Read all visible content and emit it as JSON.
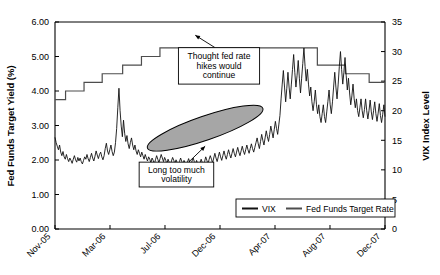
{
  "chart_data": {
    "type": "line",
    "title": "",
    "xlabel": "",
    "ylabel": "Fed Funds Target Yield (%)",
    "y2label": "VIX Index Level",
    "ylim": [
      0.0,
      6.0
    ],
    "y2lim": [
      0,
      35
    ],
    "grid": false,
    "legend_position": "bottom-right",
    "y_ticks": [
      "0.00",
      "1.00",
      "2.00",
      "3.00",
      "4.00",
      "5.00",
      "6.00"
    ],
    "y_tick_values": [
      0.0,
      1.0,
      2.0,
      3.0,
      4.0,
      5.0,
      6.0
    ],
    "y2_ticks": [
      "0",
      "5",
      "10",
      "15",
      "20",
      "25",
      "30",
      "35"
    ],
    "y2_tick_values": [
      0,
      5,
      10,
      15,
      20,
      25,
      30,
      35
    ],
    "x_ticks": [
      "Nov-05",
      "Mar-06",
      "Jul-06",
      "Dec-06",
      "Apr-07",
      "Aug-07",
      "Dec-07"
    ],
    "x_tick_positions": [
      0.0,
      0.1667,
      0.3333,
      0.5,
      0.6667,
      0.8333,
      1.0
    ],
    "series": [
      {
        "name": "Fed Funds Target Rate",
        "axis": "left",
        "color": "#4d4d4d",
        "style": "step",
        "points": [
          [
            0.0,
            3.75
          ],
          [
            0.032,
            3.75
          ],
          [
            0.032,
            4.0
          ],
          [
            0.088,
            4.0
          ],
          [
            0.088,
            4.25
          ],
          [
            0.143,
            4.25
          ],
          [
            0.143,
            4.5
          ],
          [
            0.205,
            4.5
          ],
          [
            0.205,
            4.75
          ],
          [
            0.262,
            4.75
          ],
          [
            0.262,
            5.0
          ],
          [
            0.318,
            5.0
          ],
          [
            0.318,
            5.25
          ],
          [
            0.795,
            5.25
          ],
          [
            0.795,
            4.75
          ],
          [
            0.88,
            4.75
          ],
          [
            0.88,
            4.5
          ],
          [
            0.952,
            4.5
          ],
          [
            0.952,
            4.25
          ],
          [
            1.0,
            4.25
          ]
        ]
      },
      {
        "name": "VIX",
        "axis": "right",
        "color": "#111111",
        "style": "line",
        "values": [
          15.5,
          14.6,
          14.0,
          13.4,
          14.2,
          13.0,
          12.4,
          13.1,
          12.2,
          11.8,
          12.6,
          11.9,
          11.4,
          12.0,
          11.6,
          11.1,
          11.8,
          12.4,
          11.7,
          11.3,
          12.1,
          11.5,
          12.0,
          11.4,
          11.0,
          11.6,
          12.2,
          11.8,
          12.6,
          11.9,
          11.4,
          12.1,
          12.8,
          12.0,
          11.5,
          12.3,
          13.2,
          12.5,
          11.9,
          12.6,
          13.0,
          12.2,
          11.7,
          12.4,
          13.6,
          14.5,
          13.2,
          12.6,
          13.4,
          14.2,
          13.1,
          12.4,
          13.0,
          14.6,
          17.0,
          20.5,
          23.8,
          20.0,
          17.4,
          15.6,
          18.4,
          16.2,
          14.8,
          15.8,
          14.4,
          13.6,
          14.6,
          15.4,
          14.2,
          13.4,
          14.2,
          13.2,
          12.6,
          13.4,
          12.8,
          12.2,
          13.0,
          12.4,
          11.8,
          12.6,
          12.0,
          11.5,
          12.2,
          11.8,
          11.2,
          12.0,
          11.6,
          11.0,
          11.7,
          12.4,
          11.8,
          11.2,
          11.9,
          12.6,
          12.0,
          11.4,
          12.1,
          11.6,
          11.0,
          11.8,
          11.3,
          10.8,
          11.5,
          12.1,
          11.6,
          11.0,
          11.7,
          11.2,
          10.7,
          11.4,
          12.0,
          11.4,
          10.9,
          11.6,
          11.1,
          10.6,
          11.3,
          11.9,
          11.3,
          10.8,
          11.5,
          12.0,
          11.4,
          10.9,
          11.6,
          11.0,
          10.5,
          11.2,
          11.8,
          11.2,
          10.7,
          11.4,
          12.2,
          11.6,
          11.0,
          11.8,
          12.4,
          11.8,
          11.2,
          12.0,
          12.8,
          12.0,
          11.4,
          12.2,
          13.0,
          12.2,
          11.6,
          12.4,
          13.2,
          12.4,
          11.8,
          12.6,
          13.4,
          12.6,
          12.0,
          12.8,
          13.6,
          12.8,
          12.2,
          13.0,
          13.8,
          13.0,
          12.4,
          13.2,
          14.0,
          13.2,
          12.6,
          13.4,
          14.2,
          13.4,
          12.8,
          13.6,
          14.4,
          13.6,
          13.0,
          13.8,
          14.6,
          15.4,
          14.4,
          13.6,
          14.8,
          16.0,
          15.0,
          14.2,
          15.4,
          16.6,
          15.6,
          14.8,
          16.0,
          17.4,
          16.4,
          15.4,
          16.8,
          18.2,
          17.0,
          16.0,
          17.6,
          19.2,
          22.0,
          24.5,
          26.8,
          24.0,
          21.5,
          23.8,
          26.5,
          24.0,
          22.0,
          24.5,
          27.0,
          29.5,
          26.5,
          24.0,
          26.0,
          28.5,
          25.5,
          23.0,
          25.5,
          28.0,
          30.6,
          27.5,
          25.0,
          27.0,
          24.5,
          22.5,
          24.0,
          21.5,
          20.0,
          21.5,
          23.5,
          21.0,
          19.5,
          21.0,
          19.0,
          18.0,
          19.5,
          21.0,
          19.0,
          18.0,
          19.8,
          21.6,
          23.5,
          21.0,
          19.5,
          21.5,
          24.0,
          26.5,
          24.0,
          22.0,
          24.5,
          27.5,
          30.0,
          27.0,
          24.5,
          26.5,
          29.0,
          26.0,
          23.5,
          25.5,
          23.0,
          21.0,
          22.5,
          24.5,
          22.0,
          20.5,
          22.0,
          20.0,
          19.0,
          20.5,
          22.0,
          20.0,
          18.8,
          20.2,
          22.0,
          20.0,
          18.6,
          20.0,
          21.8,
          19.8,
          18.5,
          20.0,
          21.5,
          19.5,
          18.2,
          19.6,
          21.2,
          19.2,
          18.0,
          19.4,
          21.0,
          19.0
        ]
      }
    ],
    "annotations": [
      {
        "id": "annotation-fed-hikes",
        "text_lines": [
          "Thought fed rate",
          "hikes would",
          "continue"
        ],
        "box": {
          "x": 0.374,
          "y": 0.124,
          "w": 0.246,
          "h": 0.176
        },
        "arrow_from": [
          0.485,
          0.124
        ],
        "arrow_to": [
          0.425,
          0.064
        ]
      },
      {
        "id": "annotation-volatility",
        "text_lines": [
          "Long too much",
          "volatility"
        ],
        "box": {
          "x": 0.255,
          "y": 0.677,
          "w": 0.226,
          "h": 0.12
        },
        "arrow_from": [
          0.405,
          0.677
        ],
        "arrow_to": [
          0.455,
          0.6
        ]
      }
    ],
    "shapes": [
      {
        "id": "highlight-ellipse",
        "type": "ellipse",
        "fill": "#a6a6a6",
        "stroke": "#000000",
        "cx": 0.455,
        "cy": 0.513,
        "rx": 0.185,
        "ry": 0.058,
        "rotation_deg": -19
      }
    ],
    "legend": [
      {
        "label": "VIX",
        "color": "#111111"
      },
      {
        "label": "Fed Funds Target Rate",
        "color": "#4d4d4d"
      }
    ]
  }
}
